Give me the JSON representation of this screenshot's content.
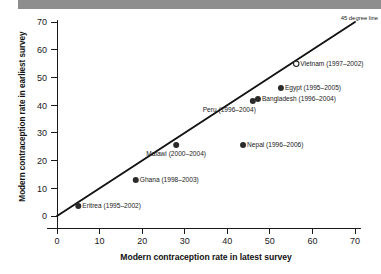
{
  "chart_data": {
    "type": "scatter",
    "title": "",
    "xlabel": "Modern contraception rate in latest survey",
    "ylabel": "Modern contraception rate in earliest survey",
    "xlim": [
      0,
      70
    ],
    "ylim": [
      0,
      70
    ],
    "xticks": [
      0,
      10,
      20,
      30,
      40,
      50,
      60,
      70
    ],
    "yticks": [
      0,
      10,
      20,
      30,
      40,
      50,
      60,
      70
    ],
    "grid": false,
    "legend": "none",
    "reference_line": {
      "label": "45 degree line",
      "from": [
        0,
        0
      ],
      "to": [
        70,
        70
      ]
    },
    "points": [
      {
        "label": "Eritrea (1995–2002)",
        "x": 5.0,
        "y": 3.6,
        "marker": "filled",
        "label_pos": "right"
      },
      {
        "label": "Ghana (1998–2003)",
        "x": 18.5,
        "y": 13.0,
        "marker": "filled",
        "label_pos": "right"
      },
      {
        "label": "Malawi (2000–2004)",
        "x": 28.0,
        "y": 25.6,
        "marker": "filled",
        "label_pos": "below"
      },
      {
        "label": "Nepal (1996–2006)",
        "x": 43.7,
        "y": 25.6,
        "marker": "filled",
        "label_pos": "right"
      },
      {
        "label": "Peru (1996–2004)",
        "x": 46.0,
        "y": 41.5,
        "marker": "filled",
        "label_pos": "below-left"
      },
      {
        "label": "Bangladesh (1996–2004)",
        "x": 47.2,
        "y": 42.2,
        "marker": "filled",
        "label_pos": "right"
      },
      {
        "label": "Egypt (1995–2005)",
        "x": 52.6,
        "y": 46.2,
        "marker": "filled",
        "label_pos": "right"
      },
      {
        "label": "Vietnam (1997–2002)",
        "x": 56.2,
        "y": 54.9,
        "marker": "open",
        "label_pos": "right"
      }
    ]
  },
  "colors": {
    "banner": "#8e8e8e",
    "ink": "#1a1a1a",
    "marker": "#2b2b2b",
    "background": "#ffffff"
  }
}
